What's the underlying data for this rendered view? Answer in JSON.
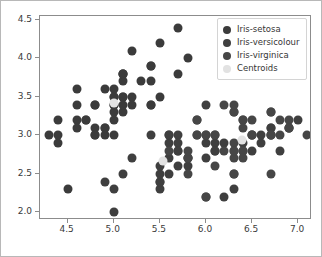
{
  "chart_data": {
    "type": "scatter",
    "title": "",
    "xlabel": "",
    "ylabel": "",
    "xlim": [
      4.2,
      7.15
    ],
    "ylim": [
      1.9,
      4.55
    ],
    "xticks": [
      "4.5",
      "5.0",
      "5.5",
      "6.0",
      "6.5",
      "7.0"
    ],
    "xtick_values": [
      4.5,
      5.0,
      5.5,
      6.0,
      6.5,
      7.0
    ],
    "yticks": [
      "2.0",
      "2.5",
      "3.0",
      "3.5",
      "4.0",
      "4.5"
    ],
    "ytick_values": [
      2.0,
      2.5,
      3.0,
      3.5,
      4.0,
      4.5
    ],
    "grid": false,
    "legend_position": "upper right",
    "colors": {
      "setosa": "#3b3b3b",
      "versicolour": "#3f3f3f",
      "virginica": "#464646",
      "centroids": "#e2e2e2",
      "axis": "#8c8c8c",
      "frame": "#b8b8b8",
      "text": "#3a3a3a"
    },
    "series": [
      {
        "name": "Iris-setosa",
        "marker": "circle",
        "color": "#3b3b3b",
        "points": [
          [
            5.1,
            3.5
          ],
          [
            4.9,
            3.0
          ],
          [
            4.7,
            3.2
          ],
          [
            4.6,
            3.1
          ],
          [
            5.0,
            3.6
          ],
          [
            5.4,
            3.9
          ],
          [
            4.6,
            3.4
          ],
          [
            5.0,
            3.4
          ],
          [
            4.4,
            2.9
          ],
          [
            4.9,
            3.1
          ],
          [
            5.4,
            3.7
          ],
          [
            4.8,
            3.4
          ],
          [
            4.8,
            3.0
          ],
          [
            4.3,
            3.0
          ],
          [
            5.8,
            4.0
          ],
          [
            5.7,
            4.4
          ],
          [
            5.4,
            3.9
          ],
          [
            5.1,
            3.5
          ],
          [
            5.7,
            3.8
          ],
          [
            5.1,
            3.8
          ],
          [
            5.4,
            3.4
          ],
          [
            5.1,
            3.7
          ],
          [
            4.6,
            3.6
          ],
          [
            5.1,
            3.3
          ],
          [
            4.8,
            3.4
          ],
          [
            5.0,
            3.0
          ],
          [
            5.0,
            3.4
          ],
          [
            5.2,
            3.5
          ],
          [
            5.2,
            3.4
          ],
          [
            4.7,
            3.2
          ],
          [
            4.8,
            3.1
          ],
          [
            5.4,
            3.4
          ],
          [
            5.2,
            4.1
          ],
          [
            5.5,
            4.2
          ],
          [
            4.9,
            3.1
          ],
          [
            5.0,
            3.2
          ],
          [
            5.5,
            3.5
          ],
          [
            4.9,
            3.6
          ],
          [
            4.4,
            3.0
          ],
          [
            5.1,
            3.4
          ],
          [
            5.0,
            3.5
          ],
          [
            4.5,
            2.3
          ],
          [
            4.4,
            3.2
          ],
          [
            5.0,
            3.5
          ],
          [
            5.1,
            3.8
          ],
          [
            4.8,
            3.0
          ],
          [
            5.1,
            3.8
          ],
          [
            4.6,
            3.2
          ],
          [
            5.3,
            3.7
          ],
          [
            5.0,
            3.3
          ]
        ]
      },
      {
        "name": "Iris-versicolour",
        "marker": "circle",
        "color": "#3f3f3f",
        "points": [
          [
            7.0,
            3.2
          ],
          [
            6.4,
            3.2
          ],
          [
            6.9,
            3.1
          ],
          [
            5.5,
            2.3
          ],
          [
            6.5,
            2.8
          ],
          [
            5.7,
            2.8
          ],
          [
            6.3,
            3.3
          ],
          [
            4.9,
            2.4
          ],
          [
            6.6,
            2.9
          ],
          [
            5.2,
            2.7
          ],
          [
            5.0,
            2.0
          ],
          [
            5.9,
            3.0
          ],
          [
            6.0,
            2.2
          ],
          [
            6.1,
            2.9
          ],
          [
            5.6,
            2.9
          ],
          [
            6.7,
            3.1
          ],
          [
            5.6,
            3.0
          ],
          [
            5.8,
            2.7
          ],
          [
            6.2,
            2.2
          ],
          [
            5.6,
            2.5
          ],
          [
            5.9,
            3.2
          ],
          [
            6.1,
            2.8
          ],
          [
            6.3,
            2.5
          ],
          [
            6.1,
            2.8
          ],
          [
            6.4,
            2.9
          ],
          [
            6.6,
            3.0
          ],
          [
            6.8,
            2.8
          ],
          [
            6.7,
            3.0
          ],
          [
            6.0,
            2.9
          ],
          [
            5.7,
            2.6
          ],
          [
            5.5,
            2.4
          ],
          [
            5.5,
            2.4
          ],
          [
            5.8,
            2.7
          ],
          [
            6.0,
            2.7
          ],
          [
            5.4,
            3.0
          ],
          [
            6.0,
            3.4
          ],
          [
            6.7,
            3.1
          ],
          [
            6.3,
            2.3
          ],
          [
            5.6,
            3.0
          ],
          [
            5.5,
            2.5
          ],
          [
            5.5,
            2.6
          ],
          [
            6.1,
            3.0
          ],
          [
            5.8,
            2.6
          ],
          [
            5.0,
            2.3
          ],
          [
            5.6,
            2.7
          ],
          [
            5.7,
            3.0
          ],
          [
            5.7,
            2.9
          ],
          [
            6.2,
            2.9
          ],
          [
            5.1,
            2.5
          ],
          [
            5.7,
            2.8
          ]
        ]
      },
      {
        "name": "Iris-virginica",
        "marker": "circle",
        "color": "#464646",
        "points": [
          [
            6.3,
            3.3
          ],
          [
            5.8,
            2.7
          ],
          [
            7.1,
            3.0
          ],
          [
            6.3,
            2.9
          ],
          [
            6.5,
            3.0
          ],
          [
            6.9,
            3.1
          ],
          [
            5.8,
            2.5
          ],
          [
            6.7,
            2.5
          ],
          [
            6.7,
            3.0
          ],
          [
            6.3,
            2.8
          ],
          [
            6.2,
            2.8
          ],
          [
            6.4,
            2.8
          ],
          [
            6.5,
            3.0
          ],
          [
            6.4,
            3.2
          ],
          [
            6.8,
            3.0
          ],
          [
            6.0,
            2.2
          ],
          [
            6.9,
            3.2
          ],
          [
            6.7,
            3.3
          ],
          [
            6.9,
            3.1
          ],
          [
            5.8,
            2.8
          ],
          [
            6.8,
            3.2
          ],
          [
            6.7,
            3.3
          ],
          [
            6.7,
            3.0
          ],
          [
            6.3,
            2.5
          ],
          [
            6.5,
            3.0
          ],
          [
            6.2,
            3.4
          ],
          [
            5.9,
            3.0
          ],
          [
            6.1,
            2.6
          ],
          [
            6.4,
            3.1
          ],
          [
            6.0,
            3.0
          ],
          [
            6.3,
            2.7
          ],
          [
            6.3,
            2.8
          ],
          [
            6.4,
            2.8
          ],
          [
            6.1,
            3.0
          ],
          [
            6.0,
            3.0
          ],
          [
            5.6,
            2.8
          ],
          [
            6.3,
            3.4
          ],
          [
            5.9,
            3.2
          ],
          [
            6.5,
            3.2
          ],
          [
            6.4,
            2.7
          ]
        ]
      },
      {
        "name": "Centroids",
        "marker": "circle",
        "color": "#e2e2e2",
        "points": [
          [
            5.0,
            3.42
          ],
          [
            5.53,
            2.66
          ],
          [
            6.39,
            2.94
          ]
        ]
      }
    ]
  },
  "legend": {
    "items": [
      {
        "label": "Iris-setosa",
        "color": "#3b3b3b"
      },
      {
        "label": "Iris-versicolour",
        "color": "#3f3f3f"
      },
      {
        "label": "Iris-virginica",
        "color": "#464646"
      },
      {
        "label": "Centroids",
        "color": "#e2e2e2"
      }
    ]
  }
}
